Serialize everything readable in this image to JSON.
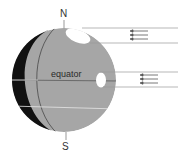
{
  "diagram": {
    "labels": {
      "north": "N",
      "south": "S",
      "equator": "equator"
    },
    "colors": {
      "lit_side": "#a6a6a6",
      "dark_side": "#111111",
      "beam_spot": "#ffffff",
      "beam_lines": "#9a9a9a",
      "arrows": "#555555",
      "equator_line": "#6e6e6e",
      "latitude_line": "#e8e8e8"
    },
    "beams": [
      {
        "name": "high-latitude-beam",
        "direction": "left",
        "arrow_count": 3
      },
      {
        "name": "equator-beam",
        "direction": "left",
        "arrow_count": 3
      }
    ]
  }
}
